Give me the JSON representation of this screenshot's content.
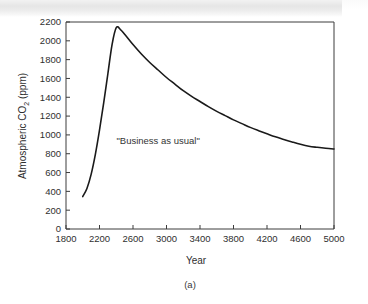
{
  "figure": {
    "caption": "(a)",
    "annotation": "\"Business as usual\"",
    "line_color": "#1a1a1a",
    "axis_color": "#3c3c3c",
    "background_color": "#ffffff"
  },
  "chart_data": {
    "type": "line",
    "title": "",
    "xlabel": "Year",
    "ylabel_prefix": "Atmospheric CO",
    "ylabel_sub": "2",
    "ylabel_suffix": " (ppm)",
    "ylabel": "Atmospheric CO2 (ppm)",
    "xlim": [
      1800,
      5000
    ],
    "ylim": [
      0,
      2200
    ],
    "grid": false,
    "legend": null,
    "xticks": [
      1800,
      2200,
      2600,
      3000,
      3400,
      3800,
      4200,
      4600,
      5000
    ],
    "xtick_labels": [
      "1800",
      "2200",
      "2600",
      "3000",
      "3400",
      "3800",
      "4200",
      "4600",
      "5000"
    ],
    "yticks": [
      0,
      200,
      400,
      600,
      800,
      1000,
      1200,
      1400,
      1600,
      1800,
      2000,
      2200
    ],
    "ytick_labels": [
      "0",
      "200",
      "400",
      "600",
      "800",
      "1000",
      "1200",
      "1400",
      "1600",
      "1800",
      "2000",
      "2200"
    ],
    "annotations": [
      {
        "text": "\"Business as usual\"",
        "x": 2900,
        "y": 900
      }
    ],
    "series": [
      {
        "name": "Business as usual",
        "x": [
          2000,
          2050,
          2100,
          2150,
          2200,
          2250,
          2300,
          2350,
          2400,
          2450,
          2500,
          2600,
          2700,
          2800,
          2900,
          3000,
          3100,
          3200,
          3300,
          3400,
          3500,
          3600,
          3700,
          3800,
          3900,
          4000,
          4100,
          4200,
          4300,
          4400,
          4500,
          4600,
          4700,
          4800,
          4900,
          5000
        ],
        "y": [
          345,
          430,
          580,
          790,
          1050,
          1340,
          1650,
          1960,
          2140,
          2120,
          2070,
          1960,
          1860,
          1770,
          1690,
          1610,
          1540,
          1470,
          1410,
          1355,
          1300,
          1250,
          1205,
          1160,
          1120,
          1080,
          1045,
          1012,
          980,
          952,
          925,
          900,
          880,
          868,
          858,
          850
        ]
      }
    ]
  }
}
